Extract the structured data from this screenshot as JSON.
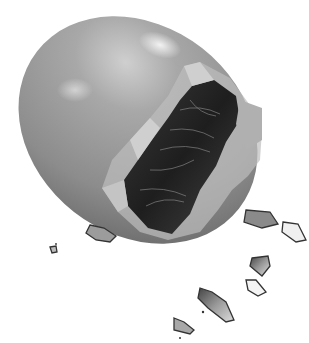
{
  "image": {
    "description": "Grayscale illustration of a cracked egg with a hatching chick visible inside and shell fragments falling",
    "colors": {
      "background": "#ffffff",
      "shell_light": "#d0d0d0",
      "shell_mid": "#9a9a9a",
      "shell_dark": "#6e6e6e",
      "interior_dark": "#2a2a2a",
      "interior_mid": "#555555",
      "fragment_outline": "#333333"
    }
  }
}
